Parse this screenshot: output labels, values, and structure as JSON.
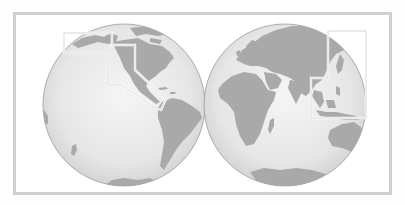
{
  "map": {
    "projection": "two-hemisphere orthographic",
    "colors": {
      "frame": "#cfcfcf",
      "ocean_center": "#f4f4f4",
      "ocean_edge": "#d6d6d6",
      "land": "#a9a9a9",
      "globe_outline": "#9a9a9a",
      "highlight_box": "#ffffff"
    },
    "hemispheres": [
      {
        "name": "western-hemisphere",
        "center": [
          124,
          105
        ],
        "radius": 81,
        "landmasses": [
          "North America",
          "South America",
          "Alaska",
          "Greenland",
          "Antarctica",
          "New Zealand"
        ]
      },
      {
        "name": "eastern-hemisphere",
        "center": [
          285,
          105
        ],
        "radius": 81,
        "landmasses": [
          "Europe",
          "Asia",
          "Africa",
          "Madagascar",
          "Arabian Peninsula",
          "India",
          "Southeast Asia",
          "Australia",
          "Antarctica"
        ]
      }
    ],
    "highlight_regions": [
      {
        "name": "pacific-coast-americas-region",
        "points": "64,33 112,33 112,45 135,45 135,70 166,99 161,110 154,107 122,85 108,85 108,53 64,53"
      },
      {
        "name": "east-southeast-asia-region",
        "points": "328,31 366,31 366,118 311,118 311,78 328,78"
      }
    ]
  }
}
